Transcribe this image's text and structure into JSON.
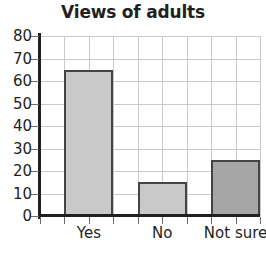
{
  "chart_data": {
    "type": "bar",
    "title": "Views of adults",
    "xlabel": "",
    "ylabel": "",
    "categories": [
      "Yes",
      "No",
      "Not sure"
    ],
    "values": [
      65,
      15,
      25
    ],
    "series": [
      {
        "name": "Views of adults",
        "values": [
          65,
          15,
          25
        ]
      }
    ],
    "ylim": [
      0,
      80
    ],
    "ytick_values": [
      0,
      10,
      20,
      30,
      40,
      50,
      60,
      70,
      80
    ],
    "ytick_labels": [
      "0",
      "10",
      "20",
      "30",
      "40",
      "50",
      "60",
      "70",
      "80"
    ],
    "grid": true,
    "legend": false,
    "bar_colors": [
      "#c9c9c9",
      "#c9c9c9",
      "#a6a6a6"
    ],
    "bar_edge_color": "#444444",
    "axis_color": "#231f20",
    "grid_color": "#c9c9c9",
    "background_color": "#ffffff",
    "text_color": "#231f20"
  }
}
